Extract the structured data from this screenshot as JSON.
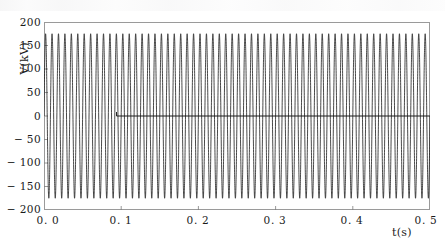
{
  "figure": {
    "background_color": "#ffffff",
    "frame_color": "#9a9a9a",
    "trace_color": "#1a1a1a",
    "reference_line_color": "#1a1a1a",
    "ylabel": "V(kV)",
    "xlabel": "t(s)",
    "ytick_labels": [
      "200",
      "150",
      "100",
      "50",
      "0",
      "− 50",
      "− 100",
      "− 150",
      "− 200"
    ],
    "xtick_labels": [
      "0. 0",
      "0. 1",
      "0. 2",
      "0. 3",
      "0. 4",
      "0. 5"
    ]
  },
  "chart_data": {
    "type": "line",
    "title": "",
    "subtitle": "",
    "xlabel": "t(s)",
    "ylabel": "V(kV)",
    "xlim": [
      0.0,
      0.5
    ],
    "ylim": [
      -200,
      200
    ],
    "xticks": [
      0.0,
      0.1,
      0.2,
      0.3,
      0.4,
      0.5
    ],
    "yticks": [
      -200,
      -150,
      -100,
      -50,
      0,
      50,
      100,
      150,
      200
    ],
    "xtick_labels": [
      "0. 0",
      "0. 1",
      "0. 2",
      "0. 3",
      "0. 4",
      "0. 5"
    ],
    "ytick_labels": [
      "− 200",
      "− 150",
      "− 100",
      "− 50",
      "0",
      "50",
      "100",
      "150",
      "200"
    ],
    "grid": false,
    "legend": null,
    "legend_position": "none",
    "series": [
      {
        "name": "voltage-waveform",
        "kind": "sinusoid",
        "amplitude_kv": 175,
        "frequency_hz": 120,
        "phase_deg": 0,
        "offset_kv": 0,
        "x_start": 0.0,
        "x_end": 0.5,
        "color": "#1a1a1a",
        "linewidth": 0.8,
        "description": "High-frequency sinusoidal voltage oscillating between about +175 kV and -175 kV across the whole 0 to 0.5 s record"
      },
      {
        "name": "zero-reference-line",
        "kind": "horizontal-line",
        "value_kv": 0,
        "x_start": 0.094,
        "x_end": 0.5,
        "color": "#1a1a1a",
        "linewidth": 1.0,
        "description": "Flat reference trace at 0 kV that starts near t = 0.1 s and continues to the right edge of the axes"
      }
    ],
    "annotations": [
      {
        "name": "reference-line-onset",
        "x": 0.094,
        "y": 0,
        "text": ""
      }
    ]
  }
}
